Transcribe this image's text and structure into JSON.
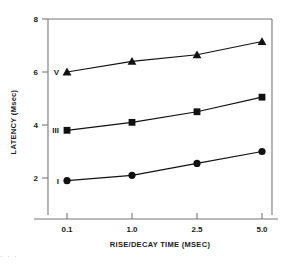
{
  "chart_data": {
    "type": "line",
    "title": "",
    "xlabel": "RISE/DECAY TIME (MSEC)",
    "ylabel": "LATENCY (Msec)",
    "categories": [
      "0.1",
      "1.0",
      "2.5",
      "5.0"
    ],
    "x_tick_labels": [
      "0.1",
      "1.0",
      "2.5",
      "5.0"
    ],
    "y_tick_labels": [
      "2",
      "4",
      "6",
      "8"
    ],
    "y_ticks": [
      2,
      4,
      6,
      8
    ],
    "ylim": [
      0.6,
      8
    ],
    "grid": false,
    "legend_position": "inline-left",
    "series": [
      {
        "name": "V",
        "marker": "triangle",
        "label": "V",
        "values": [
          6.0,
          6.4,
          6.65,
          7.15
        ]
      },
      {
        "name": "III",
        "marker": "square",
        "label": "III",
        "values": [
          3.8,
          4.1,
          4.5,
          5.05
        ]
      },
      {
        "name": "I",
        "marker": "circle",
        "label": "I",
        "values": [
          1.9,
          2.1,
          2.55,
          3.0
        ]
      }
    ],
    "colors": {
      "line": "#111111",
      "marker": "#111111",
      "axis": "#777777",
      "text": "#1a1a1a",
      "background": "#ffffff"
    }
  },
  "caption": {
    "text": "· · ·"
  }
}
